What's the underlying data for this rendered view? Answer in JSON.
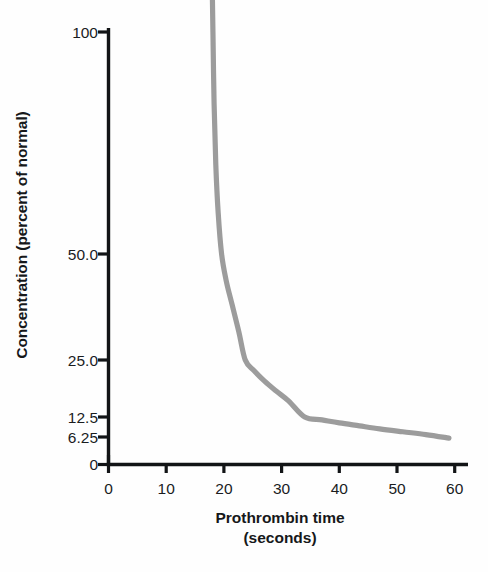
{
  "chart_data": {
    "type": "line",
    "title": "",
    "xlabel": "Prothrombin time (seconds)",
    "xlabel_line1": "Prothrombin time",
    "xlabel_line2": "(seconds)",
    "ylabel": "Concentration (percent of normal)",
    "xlim": [
      0,
      62
    ],
    "ylim": [
      0,
      110
    ],
    "grid": false,
    "legend": "none",
    "y_scale": "log-like (successive halving, 0 at baseline)",
    "x_tick_labels": [
      "0",
      "10",
      "20",
      "30",
      "40",
      "50",
      "60"
    ],
    "x_tick_values": [
      0,
      10,
      20,
      30,
      40,
      50,
      60
    ],
    "y_tick_labels": [
      "100",
      "50.0",
      "25.0",
      "12.5",
      "6.25",
      "0"
    ],
    "y_tick_values": [
      100,
      50.0,
      25.0,
      12.5,
      6.25,
      0
    ],
    "series": [
      {
        "name": "Prothrombin activity curve",
        "color": "#9c9c9c",
        "x": [
          18.0,
          18.1,
          18.3,
          18.6,
          19.0,
          19.6,
          20.4,
          21.4,
          22.6,
          23.7,
          25.2,
          27.0,
          29.0,
          31.2,
          34.0,
          37.0,
          40.0,
          43.5,
          47.0,
          51.0,
          55.0,
          59.0
        ],
        "y": [
          112,
          100,
          80,
          66,
          57,
          50,
          42,
          36,
          30,
          25.0,
          22.0,
          19.4,
          17.2,
          15.2,
          12.5,
          11.3,
          10.2,
          9.2,
          8.3,
          7.5,
          6.8,
          6.0
        ]
      }
    ]
  },
  "annotations": {
    "curve_label": "concentration-vs-prothrombin-time-curve"
  },
  "colors": {
    "curve": "#9c9c9c",
    "axis": "#121416",
    "text": "#1a1c1e",
    "background": "#fefefe"
  }
}
